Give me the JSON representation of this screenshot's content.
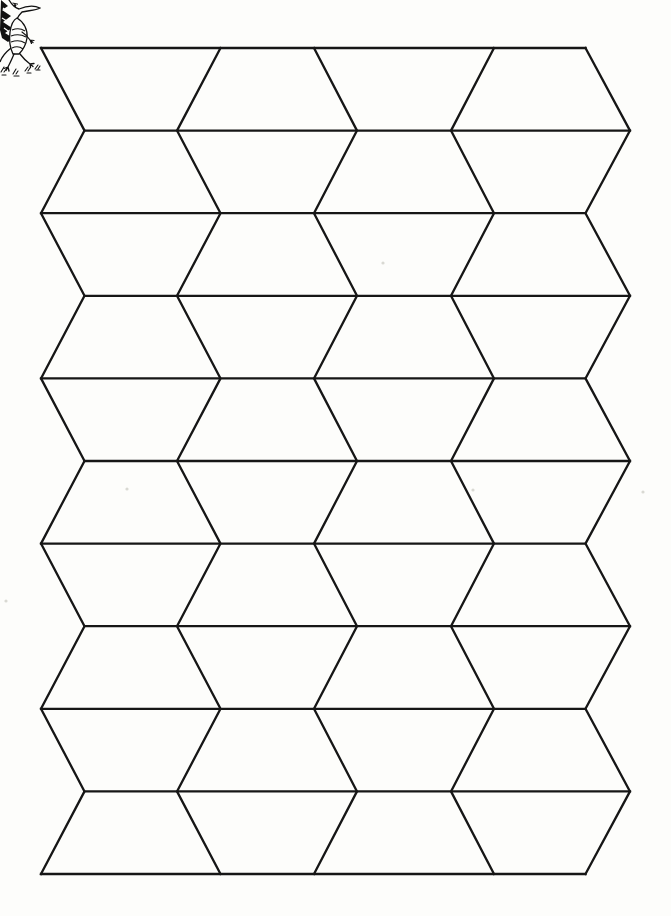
{
  "page": {
    "width": 671,
    "height": 916,
    "background": "#fdfdfb",
    "ink": "#161616"
  },
  "decoration": {
    "icon": "dragon-clipart",
    "style": "black-and-white line art, clipped by top-left page corner"
  },
  "pattern": {
    "type": "tumbler-trapezoid-tessellation",
    "description": "10 horizontal strips divided by 5 zigzag lines into alternating wide-top and narrow-top trapezoids (split elongated hexagons)",
    "stroke": "#161616",
    "stroke_width": 2.3,
    "top_y": 48,
    "row_height": 82.6,
    "row_count": 10,
    "even_row_x": [
      41,
      220.5,
      314,
      494,
      585.5
    ],
    "odd_row_x": [
      84.5,
      177,
      357,
      451,
      630
    ]
  },
  "specks": {
    "color": "#d9d9d3",
    "radius": 1.6,
    "points": [
      [
        127,
        489
      ],
      [
        643,
        492
      ],
      [
        6,
        601
      ],
      [
        473,
        490
      ],
      [
        383,
        263
      ]
    ]
  }
}
